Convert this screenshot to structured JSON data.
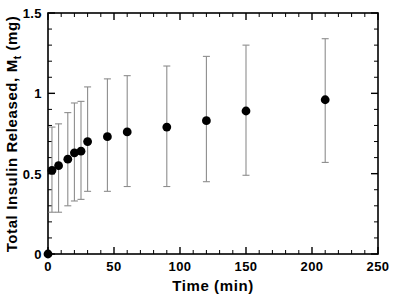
{
  "figure": {
    "background_color": "#ffffff",
    "marker_color": "#000000",
    "errorbar_color": "#8d8d8d",
    "axis_color": "#000000"
  },
  "chart_data": {
    "type": "scatter",
    "title": "",
    "subtitle": "",
    "xlabel": "Time  (min)",
    "ylabel": "Total Insulin Released, M",
    "ylabel_subscript": "t",
    "ylabel_units": "(mg)",
    "xlim": [
      0,
      250
    ],
    "ylim": [
      0,
      1.5
    ],
    "xticks": [
      0,
      50,
      100,
      150,
      200,
      250
    ],
    "xtick_labels": [
      "0",
      "50",
      "100",
      "150",
      "200",
      "250"
    ],
    "yticks": [
      0,
      0.5,
      1,
      1.5
    ],
    "ytick_labels": [
      "0",
      "0.5",
      "1",
      "1.5"
    ],
    "x_minor_interval": 10,
    "y_minor_interval": 0.1,
    "grid": false,
    "legend": null,
    "marker_style": "filled-circle",
    "has_error_bars": true,
    "error_bar_style": "capped-vertical",
    "x": [
      0,
      3,
      8,
      15,
      20,
      25,
      30,
      45,
      60,
      90,
      120,
      150,
      210
    ],
    "values": [
      0.0,
      0.52,
      0.55,
      0.59,
      0.63,
      0.64,
      0.7,
      0.73,
      0.76,
      0.79,
      0.83,
      0.89,
      0.96
    ],
    "error_low": [
      null,
      0.26,
      0.26,
      0.3,
      0.33,
      0.34,
      0.39,
      0.39,
      0.42,
      0.42,
      0.45,
      0.49,
      0.57
    ],
    "error_high": [
      null,
      0.79,
      0.81,
      0.88,
      0.94,
      0.95,
      1.04,
      1.09,
      1.11,
      1.17,
      1.23,
      1.3,
      1.34
    ],
    "series": [
      {
        "name": "Total Insulin Released",
        "x": [
          0,
          3,
          8,
          15,
          20,
          25,
          30,
          45,
          60,
          90,
          120,
          150,
          210
        ],
        "values": [
          0.0,
          0.52,
          0.55,
          0.59,
          0.63,
          0.64,
          0.7,
          0.73,
          0.76,
          0.79,
          0.83,
          0.89,
          0.96
        ]
      }
    ]
  }
}
